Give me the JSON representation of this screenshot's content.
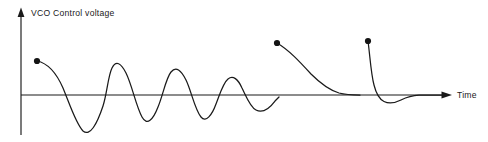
{
  "figure": {
    "background_color": "#ffffff",
    "ink_color": "#1a1a1a",
    "width": 488,
    "height": 142
  },
  "axes": {
    "y_axis": {
      "label": "VCO  Control voltage",
      "icon": "arrow-up-icon",
      "x": 21,
      "top": 9,
      "bottom": 135,
      "arrow": "up"
    },
    "x_axis": {
      "label": "Time",
      "icon": "arrow-right-icon",
      "y": 95,
      "left": 21,
      "right": 452,
      "arrow": "right"
    },
    "origin": {
      "x": 21,
      "y": 95
    }
  },
  "chart_data": {
    "type": "line",
    "xlabel": "Time",
    "ylabel": "VCO  Control voltage",
    "grid": false,
    "legend": false,
    "axis_style": "arrowed-half-axes",
    "xlim": [
      21,
      452
    ],
    "ylim": [
      135,
      9
    ],
    "baseline_y": 95,
    "series": [
      {
        "name": "underdamped-response",
        "description": "Damped ringing oscillation decaying toward the time axis",
        "start_marker": {
          "x": 37,
          "y": 61,
          "radius": 3.1
        },
        "path": "M 37 61 C 47 63, 56 72, 63 88 C 70 105, 76 124, 83 131 C 90 137, 97 124, 103 106 C 107 94, 108 76, 112 68 C 116 60, 121 63, 126 73 C 132 85, 136 106, 142 117 C 147 126, 153 120, 158 107 C 163 95, 166 78, 171 72 C 176 66, 181 70, 186 80 C 191 90, 195 110, 201 117 C 206 123, 212 115, 216 104 C 220 94, 223 83, 228 79 C 233 75, 238 79, 242 88 C 246 96, 250 107, 256 110 C 262 113, 269 109, 275 101 C 277 99, 278 98, 279 97"
      },
      {
        "name": "overdamped-response",
        "description": "Slow exponential decay settling onto the time axis without overshoot",
        "start_marker": {
          "x": 277,
          "y": 43,
          "radius": 3.1
        },
        "path": "M 277 43 C 289 50, 300 62, 311 74 C 320 83, 329 90, 339 93 C 345 94.6, 352 95, 360 95"
      },
      {
        "name": "critically-damped-response",
        "description": "Fast decay with small undershoot below the axis, then settles",
        "start_marker": {
          "x": 368,
          "y": 41,
          "radius": 3.1
        },
        "path": "M 368 41 C 370 56, 371 74, 374 85 C 376 93, 379 99, 384 101.5 C 389 104, 395 103, 401 100 C 406 97.5, 412 95.5, 419 95.2 C 426 95, 434 95, 442 95"
      }
    ]
  }
}
